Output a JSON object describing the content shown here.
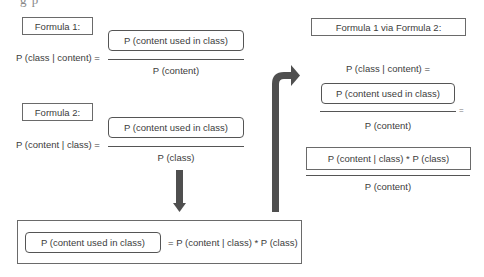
{
  "top_cutoff_text": "g                              p",
  "formula1": {
    "label": "Formula 1:",
    "lhs": "P (class | content) =",
    "numerator": "P (content used in class)",
    "denominator": "P (content)"
  },
  "formula2": {
    "label": "Formula 2:",
    "lhs": "P (content | class) =",
    "numerator": "P (content used in class)",
    "denominator": "P (class)"
  },
  "derived": {
    "boxed_term": "P (content used in class)",
    "rhs": "= P (content | class) * P (class)"
  },
  "combined": {
    "label": "Formula 1 via Formula 2:",
    "lhs": "P (class | content) =",
    "numerator": "P (content used in class)",
    "denominator": "P (content)",
    "equals": "=",
    "numerator2": "P (content | class) * P (class)",
    "denominator2": "P (content)"
  },
  "arrows": {
    "down": "down-arrow",
    "up_right": "bent-up-right-arrow",
    "color": "#4f4f4f"
  }
}
